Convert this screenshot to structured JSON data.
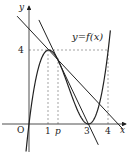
{
  "diagram": {
    "function_label": "y=f(x)",
    "function": "x(x-3)^2",
    "axis_x_label": "x",
    "axis_y_label": "y",
    "origin_label": "O",
    "x_ticks": [
      "1",
      "p",
      "3",
      "4"
    ],
    "y_ticks": [
      "4"
    ],
    "lines": [
      {
        "name": "tangent-line-at-p",
        "through": [
          [
            3,
            0
          ],
          [
            1.5,
            3.375
          ]
        ]
      },
      {
        "name": "secant-line",
        "through": [
          [
            1,
            4
          ],
          [
            4.5,
            0
          ]
        ]
      }
    ]
  }
}
